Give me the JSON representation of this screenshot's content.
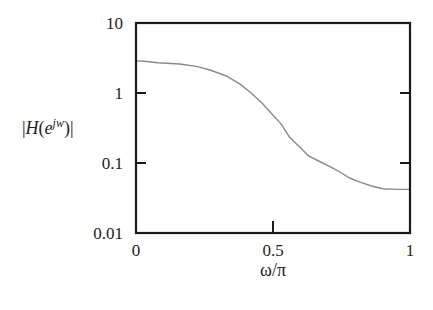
{
  "chart_data": {
    "type": "line",
    "title": "",
    "xlabel": "ω/π",
    "ylabel": "|H(e^jw)|",
    "ylabel_parts": {
      "prefix": "|H(e",
      "sup": "jw",
      "suffix": ")|"
    },
    "xlim": [
      0,
      1
    ],
    "ylim": [
      0.01,
      10
    ],
    "yscale": "log",
    "grid": false,
    "legend": null,
    "x_ticks": [
      0,
      0.5,
      1
    ],
    "x_tick_labels": [
      "0",
      "0.5",
      "1"
    ],
    "y_ticks": [
      0.01,
      0.1,
      1,
      10
    ],
    "y_tick_labels": [
      "0.01",
      "0.1",
      "1",
      "10"
    ],
    "series": [
      {
        "name": "|H(e^jw)|",
        "color": "#8a8a8a",
        "x": [
          0,
          0.03,
          0.08,
          0.16,
          0.22,
          0.27,
          0.33,
          0.38,
          0.42,
          0.46,
          0.49,
          0.53,
          0.56,
          0.6,
          0.63,
          0.67,
          0.71,
          0.75,
          0.78,
          0.82,
          0.86,
          0.9,
          0.95,
          1.0
        ],
        "values": [
          2.87,
          2.85,
          2.7,
          2.6,
          2.4,
          2.13,
          1.75,
          1.34,
          1.0,
          0.72,
          0.53,
          0.36,
          0.235,
          0.165,
          0.126,
          0.105,
          0.088,
          0.072,
          0.061,
          0.053,
          0.047,
          0.043,
          0.042,
          0.042
        ]
      }
    ]
  }
}
